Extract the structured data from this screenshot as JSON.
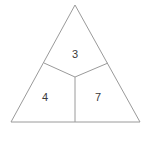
{
  "figure": {
    "type": "geometry-diagram",
    "shape": "triangle",
    "background_color": "#ffffff",
    "line_color": "#9a9a9a",
    "label_color": "#3a3a3a",
    "line_width": 1,
    "canvas": {
      "width": 146,
      "height": 147
    },
    "vertices": {
      "apex": {
        "x": 75,
        "y": 5
      },
      "bottom_left": {
        "x": 11,
        "y": 122
      },
      "bottom_right": {
        "x": 140,
        "y": 122
      }
    },
    "interior_point": {
      "name": "center",
      "x": 75,
      "y": 77
    },
    "edge_points": {
      "left_edge_point": {
        "x": 44,
        "y": 63
      },
      "right_edge_point": {
        "x": 108,
        "y": 63
      },
      "base_point": {
        "x": 75,
        "y": 122
      }
    },
    "outline_path": "M 75 5 L 140 122 L 11 122 Z",
    "divider_paths": [
      "M 44 63 L 75 77",
      "M 108 63 L 75 77",
      "M 75 77 L 75 122"
    ],
    "regions": [
      {
        "id": "top",
        "label": "3",
        "label_x": 75,
        "label_y": 55,
        "path": "M 75 5 L 108 63 L 75 77 L 44 63 Z"
      },
      {
        "id": "bottom-left",
        "label": "4",
        "label_x": 45,
        "label_y": 98,
        "path": "M 44 63 L 75 77 L 75 122 L 11 122 Z"
      },
      {
        "id": "bottom-right",
        "label": "7",
        "label_x": 98,
        "label_y": 98,
        "path": "M 75 77 L 108 63 L 140 122 L 75 122 Z"
      }
    ]
  }
}
